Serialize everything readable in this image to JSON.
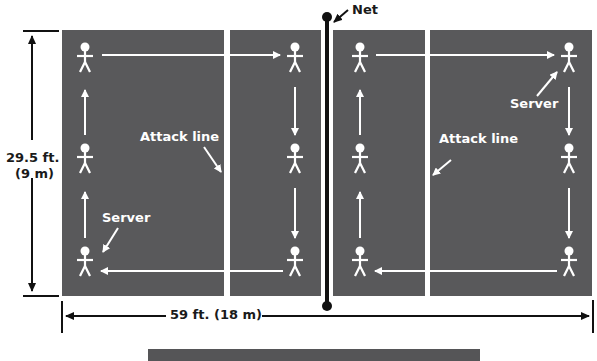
{
  "diagram": {
    "net_label": "Net",
    "attack_line_left_label": "Attack line",
    "attack_line_right_label": "Attack line",
    "server_left_label": "Server",
    "server_right_label": "Server",
    "width_label": "59 ft. (18 m)",
    "height_label_ft": "29.5 ft.",
    "height_label_m": "(9 m)",
    "colors": {
      "court": "#59595b",
      "lines": "#ffffff",
      "net": "#111111",
      "dimension": "#1a1a1a"
    },
    "left_side": {
      "players": [
        "back-left-top",
        "back-left-middle",
        "back-left-server",
        "front-top",
        "front-middle",
        "front-bottom"
      ],
      "rotation": "clockwise"
    },
    "right_side": {
      "players": [
        "front-top",
        "front-middle",
        "front-bottom",
        "back-right-server",
        "back-right-middle",
        "back-right-bottom"
      ],
      "rotation": "clockwise"
    }
  }
}
